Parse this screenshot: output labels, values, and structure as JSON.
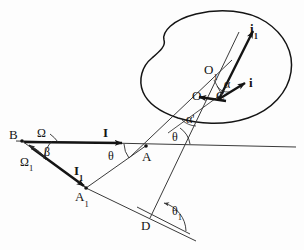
{
  "figure": {
    "type": "geometry-optics-line-drawing",
    "background_color": "#fdfdfd",
    "ink_color": "#141414",
    "canvas": {
      "width": 304,
      "height": 250
    }
  },
  "labels": {
    "B": "B",
    "omega": "Ω",
    "omega_1_base": "Ω",
    "omega_1_sub": "1",
    "beta": "β",
    "I": "I",
    "I_1_base": "I",
    "I_1_sub": "1",
    "A": "A",
    "A_1_base": "A",
    "A_1_sub": "1",
    "theta_left": "θ",
    "theta_right": "θ",
    "theta_1_base": "θ",
    "theta_1_sub": "1",
    "D": "D",
    "O": "O",
    "O_1_base": "O",
    "O_1_sub": "1",
    "C": "C",
    "i": "i",
    "i_1_base": "i",
    "i_1_sub": "1",
    "alpha": "α",
    "alpha_prime_base": "α",
    "alpha_prime_mark": "'"
  },
  "points": {
    "B": {
      "x": 22,
      "y": 141
    },
    "A": {
      "x": 146,
      "y": 146
    },
    "A1": {
      "x": 86,
      "y": 188
    },
    "D": {
      "x": 155,
      "y": 220
    },
    "O": {
      "x": 203,
      "y": 97
    },
    "O1": {
      "x": 215,
      "y": 76
    },
    "C": {
      "x": 219,
      "y": 96
    }
  },
  "vectors": [
    {
      "name": "I",
      "from": "B",
      "to": "A",
      "kind": "incident-ray-upper",
      "bold": true
    },
    {
      "name": "I1",
      "from": "B",
      "to": "A1",
      "kind": "incident-ray-lower",
      "bold": true
    },
    {
      "name": "i",
      "from": "C",
      "to": "ray-i-tip",
      "kind": "unit-vector",
      "bold": true
    },
    {
      "name": "i1",
      "from": "C",
      "to": "ray-i1-tip",
      "kind": "unit-vector",
      "bold": true
    }
  ],
  "angles": [
    {
      "name": "omega",
      "at": "B",
      "symbol": "Ω"
    },
    {
      "name": "omega_1",
      "at": "B",
      "symbol": "Ω₁"
    },
    {
      "name": "beta",
      "at": "B",
      "symbol": "β"
    },
    {
      "name": "theta",
      "at": "A",
      "symbol": "θ"
    },
    {
      "name": "theta_2",
      "at": "A",
      "symbol": "θ"
    },
    {
      "name": "theta_1",
      "at": "D",
      "symbol": "θ₁"
    },
    {
      "name": "alpha",
      "at": "O1-C",
      "symbol": "α"
    },
    {
      "name": "alpha_p",
      "at": "O-C",
      "symbol": "α'"
    }
  ]
}
